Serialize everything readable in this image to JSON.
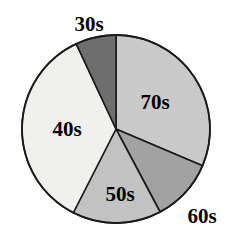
{
  "chart_data": {
    "type": "pie",
    "title": "",
    "title_clipped": true,
    "xlabel": "",
    "ylabel": "",
    "legend_position": "none",
    "grid": false,
    "categories": [
      "70s",
      "60s",
      "50s",
      "40s",
      "30s"
    ],
    "values": [
      31.4,
      10.8,
      15.3,
      35.6,
      6.9
    ],
    "labels": [
      "70s",
      "60s",
      "50s",
      "40s",
      "30s"
    ],
    "slices": [
      {
        "label": "70s",
        "value": 31.4,
        "start_angle": 0,
        "end_angle": 113,
        "color": "#c9c9c9",
        "label_placement": "inside",
        "label_x": 155,
        "label_y": 104
      },
      {
        "label": "60s",
        "value": 10.8,
        "start_angle": 113,
        "end_angle": 152,
        "color": "#a2a2a2",
        "label_placement": "outside",
        "label_x": 202,
        "label_y": 218
      },
      {
        "label": "50s",
        "value": 15.3,
        "start_angle": 152,
        "end_angle": 207,
        "color": "#c2c2c2",
        "label_placement": "inside",
        "label_x": 120,
        "label_y": 196
      },
      {
        "label": "40s",
        "value": 35.6,
        "start_angle": 207,
        "end_angle": 335,
        "color": "#f0f0ee",
        "label_placement": "inside",
        "label_x": 67,
        "label_y": 131
      },
      {
        "label": "30s",
        "value": 6.9,
        "start_angle": 335,
        "end_angle": 360,
        "color": "#6e6e6e",
        "label_placement": "outside",
        "label_x": 89,
        "label_y": 26
      }
    ],
    "geometry": {
      "center_x": 116,
      "center_y": 129,
      "radius": 94
    },
    "colors": {
      "outline": "#1a1a1a",
      "background": "#ffffff",
      "label_text": "#000000"
    }
  }
}
